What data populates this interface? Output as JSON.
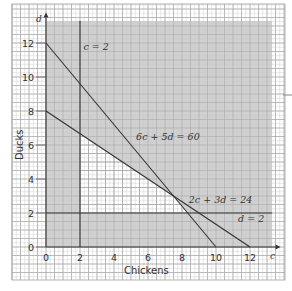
{
  "chart_data": {
    "type": "line",
    "title": "",
    "xlabel": "Chickens",
    "ylabel": "Ducks",
    "x_axis_symbol": "c",
    "y_axis_symbol": "d",
    "xlim": [
      0,
      13
    ],
    "ylim": [
      0,
      13
    ],
    "x_ticks": [
      0,
      2,
      4,
      6,
      8,
      10,
      12
    ],
    "y_ticks": [
      0,
      2,
      4,
      6,
      8,
      10,
      12
    ],
    "grid": true,
    "minor_grid_per_unit": 2,
    "series": [
      {
        "name": "6c + 5d = 60",
        "points": [
          [
            0,
            12
          ],
          [
            10,
            0
          ]
        ]
      },
      {
        "name": "2c + 3d = 24",
        "points": [
          [
            0,
            8
          ],
          [
            12,
            0
          ]
        ]
      },
      {
        "name": "c = 2",
        "points": [
          [
            2,
            0
          ],
          [
            2,
            13.3
          ]
        ]
      },
      {
        "name": "d = 2",
        "points": [
          [
            0,
            2
          ],
          [
            13.3,
            2
          ]
        ]
      }
    ],
    "annotations": [
      {
        "text": "c = 2",
        "x": 2.2,
        "y": 11.6
      },
      {
        "text": "6c + 5d = 60",
        "x": 5.3,
        "y": 6.3
      },
      {
        "text": "2c + 3d = 24",
        "x": 8.4,
        "y": 2.6
      },
      {
        "text": "d = 2",
        "x": 11.3,
        "y": 1.5
      }
    ],
    "feasible_region": {
      "unshaded": true,
      "vertices": [
        [
          2,
          2
        ],
        [
          2,
          6.667
        ],
        [
          7.5,
          3
        ],
        [
          8.333,
          2
        ]
      ]
    },
    "shaded_region_extent": {
      "c": [
        0,
        13.3
      ],
      "d": [
        0,
        13.3
      ]
    },
    "colors": {
      "shade": "#c8c8c8",
      "line": "#333333",
      "grid_major": "#9a9a9a",
      "grid_minor": "#c4c4c4"
    }
  },
  "labels": {
    "x_axis": "Chickens",
    "y_axis": "Ducks",
    "x_symbol": "c",
    "y_symbol": "d",
    "line1": "6c + 5d = 60",
    "line2": "2c + 3d = 24",
    "line3": "c = 2",
    "line4": "d = 2"
  }
}
